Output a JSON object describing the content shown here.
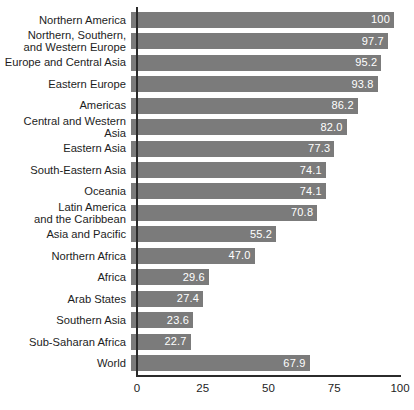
{
  "chart_data": {
    "type": "bar",
    "orientation": "horizontal",
    "title": "",
    "subtitle": "",
    "xlabel": "",
    "ylabel": "",
    "xlim": [
      0,
      100
    ],
    "grid": false,
    "legend": null,
    "bar_color": "#7b7b7b",
    "value_label_color": "#ffffff",
    "axis_color": "#2b2b2b",
    "background_color": "#ffffff",
    "xticks": [
      0,
      25,
      50,
      75,
      100
    ],
    "xtick_labels": [
      "0",
      "25",
      "50",
      "75",
      "100"
    ],
    "categories": [
      "Northern America",
      "Northern, Southern,\nand Western Europe",
      "Europe and Central Asia",
      "Eastern Europe",
      "Americas",
      "Central and Western Asia",
      "Eastern Asia",
      "South-Eastern Asia",
      "Oceania",
      "Latin America\nand the Caribbean",
      "Asia and Pacific",
      "Northern Africa",
      "Africa",
      "Arab States",
      "Southern Asia",
      "Sub-Saharan Africa",
      "World"
    ],
    "values": [
      100,
      97.7,
      95.2,
      93.8,
      86.2,
      82.0,
      77.3,
      74.1,
      74.1,
      70.8,
      55.2,
      47.0,
      29.6,
      27.4,
      23.6,
      22.7,
      67.9
    ],
    "value_labels": [
      "100",
      "97.7",
      "95.2",
      "93.8",
      "86.2",
      "82.0",
      "77.3",
      "74.1",
      "74.1",
      "70.8",
      "55.2",
      "47.0",
      "29.6",
      "27.4",
      "23.6",
      "22.7",
      "67.9"
    ]
  }
}
